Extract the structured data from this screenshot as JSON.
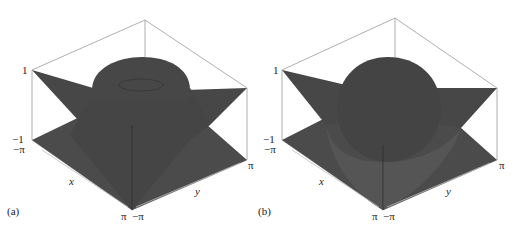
{
  "figure": {
    "panels": [
      {
        "tag": "(a)",
        "z_max_label": "1",
        "z_min_label": "−1",
        "x_axis_label": "x",
        "y_axis_label": "y",
        "x_start_label": "−π",
        "x_end_label": "π",
        "y_start_label": "−π",
        "y_end_label": "π",
        "description": "3D surface plot: square pyramid-shaped saddle surface over [−π,π]×[−π,π] with a small dome (bump) in the center"
      },
      {
        "tag": "(b)",
        "z_max_label": "1",
        "z_min_label": "−1",
        "x_axis_label": "x",
        "y_axis_label": "y",
        "x_start_label": "−π",
        "x_end_label": "π",
        "y_start_label": "−π",
        "y_end_label": "π",
        "description": "3D surface plot: same pyramid/saddle surface with a larger spherical dome in the center"
      }
    ],
    "colors": {
      "surface": "#4a4a4a",
      "surface_dark": "#3c3c3c",
      "dome": "#474747",
      "box_lines": "#9a9a9a",
      "text": "#222222"
    }
  }
}
